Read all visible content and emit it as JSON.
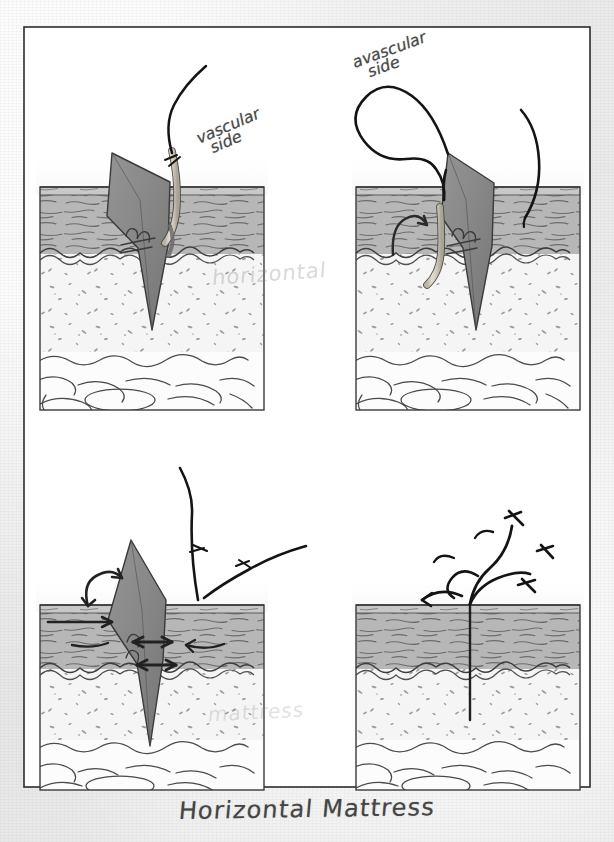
{
  "figure": {
    "caption": "Horizontal Mattress",
    "border_color": "#2b2b2b",
    "paper_color": "#e9e9e9",
    "plate_color": "#ffffff"
  },
  "labels": {
    "vascular": {
      "line1": "vascular",
      "line2": "side"
    },
    "avascular": {
      "line1": "avascular",
      "line2": "side"
    },
    "ghost_bleedthrough_1": "horizontal",
    "ghost_bleedthrough_2": "mattress"
  },
  "panels": [
    {
      "id": "panel-1",
      "position": "top-left",
      "step": 1,
      "description": "Needle entering the vascular side of the wound edge, suture thread trailing up"
    },
    {
      "id": "panel-2",
      "position": "top-right",
      "step": 2,
      "description": "Needle re-entered on the avascular side forming the horizontal loop above the skin"
    },
    {
      "id": "panel-3",
      "position": "bottom-left",
      "step": 3,
      "description": "Suture tightened, arrows showing wound edge eversion and approximation"
    },
    {
      "id": "panel-4",
      "position": "bottom-right",
      "step": 4,
      "description": "Completed horizontal mattress stitch with knot, wound closed"
    }
  ],
  "tissue_layers": [
    {
      "name": "epidermis",
      "color": "#c9c9c9"
    },
    {
      "name": "dermis",
      "color": "#b6b6b6"
    },
    {
      "name": "subcutaneous-fat",
      "color": "#f4f4f4"
    },
    {
      "name": "muscle-fascia",
      "color": "#fbfbfb"
    }
  ],
  "elements": {
    "wound_flap_color": "#8e8e8e",
    "needle_color": "#cfc9bc",
    "suture_color": "#1a1a1a",
    "arrow_color": "#2a2a2a"
  }
}
